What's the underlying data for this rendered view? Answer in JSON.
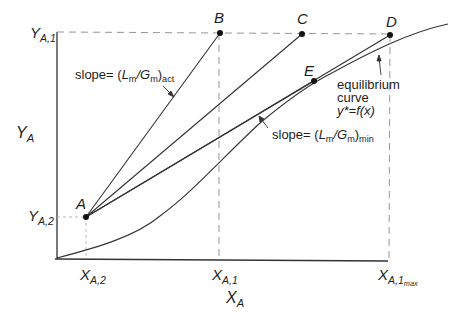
{
  "figure": {
    "type": "operating-line / equilibrium-curve diagram (gas absorption)",
    "axes": {
      "x_label": {
        "main": "X",
        "sub": "A"
      },
      "y_label": {
        "main": "Y",
        "sub": "A"
      },
      "x_ticks": [
        {
          "main": "X",
          "sub": "A,2",
          "subsub": ""
        },
        {
          "main": "X",
          "sub": "A,1",
          "subsub": ""
        },
        {
          "main": "X",
          "sub": "A,1",
          "subsub": "max"
        }
      ],
      "y_ticks": [
        {
          "main": "Y",
          "sub": "A,1"
        },
        {
          "main": "Y",
          "sub": "A,2"
        }
      ]
    },
    "points": [
      {
        "id": "A",
        "label": "A"
      },
      {
        "id": "B",
        "label": "B"
      },
      {
        "id": "C",
        "label": "C"
      },
      {
        "id": "D",
        "label": "D"
      },
      {
        "id": "E",
        "label": "E"
      }
    ],
    "annotations": {
      "slope_act": {
        "prefix": "slope= (",
        "L": "L",
        "L_sub": "m",
        "slash": "/",
        "G": "G",
        "G_sub": "m",
        "close": ")",
        "suffix_sub": "act"
      },
      "slope_min": {
        "prefix": "slope= (",
        "L": "L",
        "L_sub": "m",
        "slash": "/",
        "G": "G",
        "G_sub": "m",
        "close": ")",
        "suffix_sub": "min"
      },
      "equilibrium": {
        "line1": "equilibrium",
        "line2": "curve",
        "line3": "y*=f(x)"
      }
    },
    "colors": {
      "ink": "#1e1e1e",
      "dash": "#8a8a8a"
    }
  }
}
